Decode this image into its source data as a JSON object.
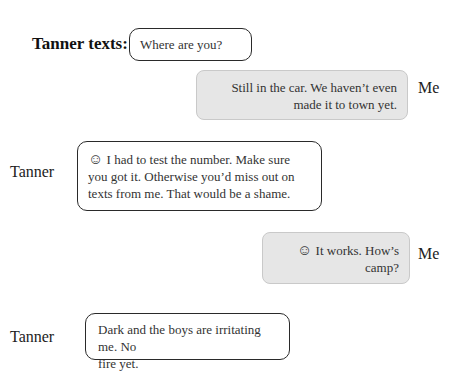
{
  "header": {
    "label": "Tanner texts:"
  },
  "messages": [
    {
      "speaker": "",
      "direction": "incoming",
      "text": "Where are you?"
    },
    {
      "speaker": "Me",
      "direction": "outgoing",
      "text_lines": [
        "Still in the car. We haven’t even",
        "made it to town yet."
      ]
    },
    {
      "speaker": "Tanner",
      "direction": "incoming",
      "emoji": "☺",
      "text_lines": [
        "I had to test the number. Make sure",
        "you got it. Otherwise you’d miss out on",
        "texts from me. That would be a shame."
      ]
    },
    {
      "speaker": "Me",
      "direction": "outgoing",
      "emoji": "☺",
      "text_lines": [
        "It works. How’s",
        "camp?"
      ]
    },
    {
      "speaker": "Tanner",
      "direction": "incoming",
      "text_lines": [
        "Dark and the boys are irritating me. No",
        "fire yet."
      ]
    }
  ],
  "colors": {
    "incoming_border": "#2a2a2a",
    "outgoing_fill": "#e6e6e6",
    "outgoing_border": "#c9c9c9"
  }
}
